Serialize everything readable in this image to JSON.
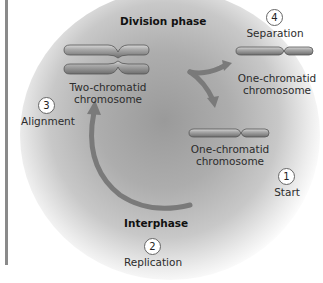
{
  "phases": {
    "division": "Division phase",
    "interphase": "Interphase"
  },
  "steps": [
    {
      "number": "1",
      "label": "Start"
    },
    {
      "number": "2",
      "label": "Replication"
    },
    {
      "number": "3",
      "label": "Alignment"
    },
    {
      "number": "4",
      "label": "Separation"
    }
  ],
  "chromosomes": {
    "two_chromatid": {
      "line1": "Two-chromatid",
      "line2": "chromosome"
    },
    "one_chromatid_top": {
      "line1": "One-chromatid",
      "line2": "chromosome"
    },
    "one_chromatid_bottom": {
      "line1": "One-chromatid",
      "line2": "chromosome"
    }
  },
  "colors": {
    "chromosome": "#8c8c8c",
    "arrow": "#7a7a7a",
    "background_glow": "#a8a8a8"
  }
}
